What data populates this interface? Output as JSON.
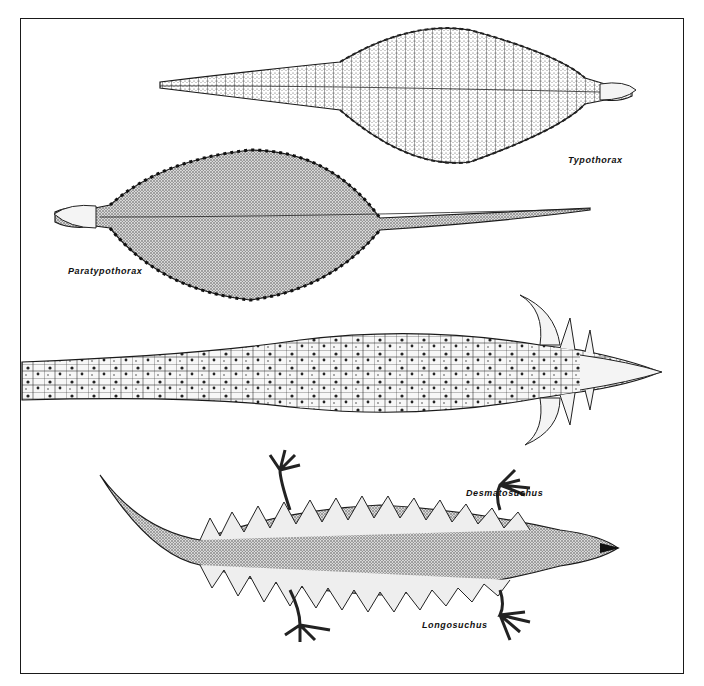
{
  "figure": {
    "type": "scientific illustration",
    "specimens": [
      {
        "id": "typothorax",
        "label": "Typothorax"
      },
      {
        "id": "paratypothorax",
        "label": "Paratypothorax"
      },
      {
        "id": "desmatosuchus",
        "label": "Desmatosuchus"
      },
      {
        "id": "longosuchus",
        "label": "Longosuchus"
      }
    ]
  },
  "colors": {
    "ink": "#1a1a1a",
    "stipple": "#8a8a8a",
    "paper": "#ffffff"
  }
}
